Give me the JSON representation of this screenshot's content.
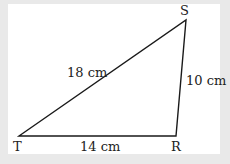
{
  "diagram": {
    "type": "triangle",
    "vertices": [
      {
        "name": "S",
        "x": 186,
        "y": 20
      },
      {
        "name": "T",
        "x": 19,
        "y": 136
      },
      {
        "name": "R",
        "x": 176,
        "y": 136
      }
    ],
    "labels": {
      "S": "S",
      "T": "T",
      "R": "R",
      "side_TS": "18 cm",
      "side_SR": "10 cm",
      "side_TR": "14 cm"
    },
    "colors": {
      "line": "#1a1a1a",
      "background": "#e9e9e9",
      "panel": "#ffffff"
    }
  }
}
